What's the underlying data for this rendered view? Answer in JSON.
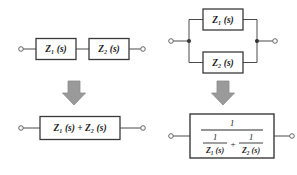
{
  "figure": {
    "background_color": "#ffffff",
    "line_color": "#4a4a4a",
    "box_border_color": "#3a3a3a",
    "text_color": "#1a1a1a",
    "arrow_fill_color": "#9a9a9a",
    "arrow_stroke_color": "#8a8a8a"
  },
  "series": {
    "caption": "Series connection",
    "block1_label": "Z₁ (s)",
    "block2_label": "Z₂ (s)",
    "result_label": "Z₁ (s) + Z₂ (s)",
    "terminal_left": "terminal",
    "terminal_right": "terminal",
    "arrow_label": "equivalent-to"
  },
  "parallel": {
    "caption": "Parallel connection",
    "block1_label": "Z₁ (s)",
    "block2_label": "Z₂ (s)",
    "result": {
      "numerator": "1",
      "denominator_term1_num": "1",
      "denominator_term1_den": "Z₁ (s)",
      "operator": "+",
      "denominator_term2_num": "1",
      "denominator_term2_den": "Z₂ (s)"
    },
    "terminal_left": "terminal",
    "terminal_right": "terminal",
    "arrow_label": "equivalent-to"
  }
}
